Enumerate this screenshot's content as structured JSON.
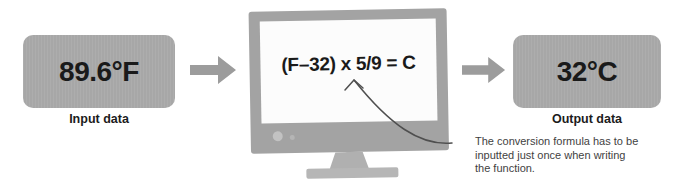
{
  "input_box": {
    "value": "89.6°F",
    "label": "Input data"
  },
  "monitor": {
    "formula": "(F–32) x 5/9 = C"
  },
  "output_box": {
    "value": "32°C",
    "label": "Output data"
  },
  "annotation": {
    "lines": [
      "The conversion formula has to be",
      "inputted just once when writing",
      "the function."
    ]
  },
  "colors": {
    "box_fill": "#a7a7a7",
    "arrow_fill": "#9c9c9c",
    "monitor_frame": "#a3a3a3",
    "monitor_screen": "#fcfcfc",
    "stand_fill": "#b0b0b0",
    "base_fill": "#b6b6b6",
    "pointer_stroke": "#4f4f4f",
    "text_dark": "#1a1a1a",
    "annotation_text": "#3f3f3f"
  }
}
